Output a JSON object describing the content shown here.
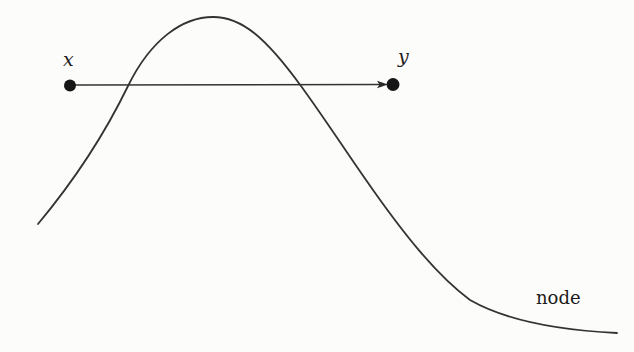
{
  "diagram": {
    "background_color": "#fcfcfa",
    "ink_color": "#333333",
    "nodes": [
      {
        "id": "x",
        "label": "x"
      },
      {
        "id": "y",
        "label": "y"
      }
    ],
    "edge": {
      "from": "x",
      "to": "y",
      "style": "arrow"
    },
    "curve_label": "node"
  }
}
